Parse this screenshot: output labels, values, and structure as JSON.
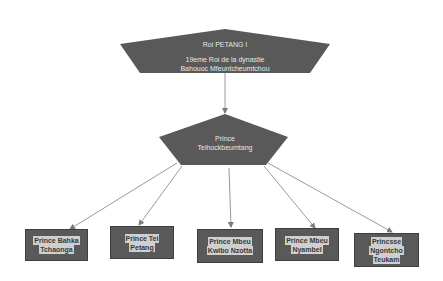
{
  "diagram": {
    "root": {
      "title": "Roi PETANG I",
      "line1": "19eme Roi de la dynastie",
      "line2": "Bahouoc Mfeuntcheumtchou"
    },
    "parent": {
      "line1": "Prince",
      "line2": "Teihockbeumtang"
    },
    "children": [
      {
        "line1": "Prince Bahka",
        "line2": "Tchaonga",
        "line3": ""
      },
      {
        "line1": "Prince Tei",
        "line2": "Petang",
        "line3": ""
      },
      {
        "line1": "Prince Mbeu",
        "line2": "Kwibo Nzotta",
        "line3": ""
      },
      {
        "line1": "Prince Mbeu",
        "line2": "Nyambel",
        "line3": ""
      },
      {
        "line1": "Princsse",
        "line2": "Ngontcho",
        "line3": "Teukam"
      }
    ],
    "colors": {
      "shape_fill": "#595959",
      "text": "#e8e8e8",
      "label_bg": "#cfcfcf",
      "connector": "#9a9a9a"
    }
  }
}
